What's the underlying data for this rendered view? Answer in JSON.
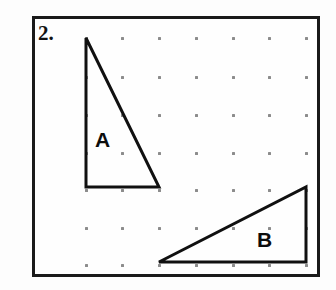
{
  "worksheet": {
    "problem_number": "2.",
    "background_color": "#fdfdfd",
    "frame": {
      "border_color": "#1a1a1a",
      "border_width_px": 3,
      "x": 32,
      "y": 16,
      "width": 288,
      "height": 261
    },
    "grid": {
      "type": "geoboard-dot-grid",
      "columns": 7,
      "rows": 7,
      "dot_color": "#8c8c8c",
      "dot_size_px": 3,
      "x_positions": [
        86,
        122,
        159,
        196,
        233,
        269,
        306
      ],
      "y_positions": [
        38,
        77,
        115,
        153,
        190,
        228,
        265
      ]
    },
    "shapes": [
      {
        "label": "A",
        "type": "right-triangle",
        "stroke_color": "#101010",
        "stroke_width_px": 3,
        "label_position": {
          "x": 95,
          "y": 129
        },
        "vertices": [
          {
            "x": 86,
            "y": 38
          },
          {
            "x": 86,
            "y": 187
          },
          {
            "x": 159,
            "y": 187
          }
        ],
        "grid_vertices": [
          {
            "col": 0,
            "row": 0
          },
          {
            "col": 0,
            "row": 4
          },
          {
            "col": 2,
            "row": 4
          }
        ]
      },
      {
        "label": "B",
        "type": "right-triangle",
        "stroke_color": "#101010",
        "stroke_width_px": 3,
        "label_position": {
          "x": 257,
          "y": 229
        },
        "vertices": [
          {
            "x": 159,
            "y": 262
          },
          {
            "x": 306,
            "y": 262
          },
          {
            "x": 306,
            "y": 187
          }
        ],
        "grid_vertices": [
          {
            "col": 2,
            "row": 6
          },
          {
            "col": 6,
            "row": 6
          },
          {
            "col": 6,
            "row": 4
          }
        ]
      }
    ]
  }
}
